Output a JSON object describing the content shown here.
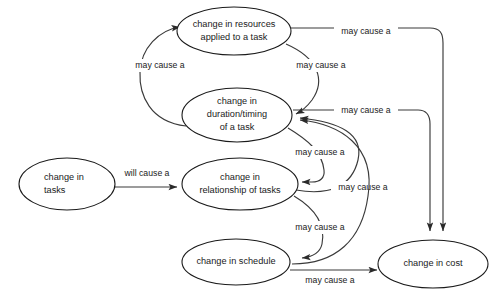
{
  "diagram": {
    "type": "causal-loop-diagram",
    "background_color": "#ffffff",
    "node_stroke_color": "#1a1a1a",
    "edge_stroke_color": "#3a3a3a",
    "text_color": "#1a1a1a",
    "nodes": [
      {
        "id": "resources",
        "label_lines": [
          "change in resources",
          "applied to a task"
        ],
        "align": "center",
        "cx": 234,
        "cy": 31,
        "rx": 57,
        "ry": 24
      },
      {
        "id": "duration",
        "label_lines": [
          "change in",
          "duration/timing",
          "of a task"
        ],
        "align": "center",
        "cx": 237,
        "cy": 115,
        "rx": 55,
        "ry": 27
      },
      {
        "id": "tasks",
        "label_lines": [
          "change in",
          "tasks"
        ],
        "align": "start",
        "cx": 67,
        "cy": 184,
        "rx": 48,
        "ry": 26
      },
      {
        "id": "relationship",
        "label_lines": [
          "change in",
          "relationship  of tasks"
        ],
        "align": "center",
        "cx": 240,
        "cy": 184,
        "rx": 58,
        "ry": 26
      },
      {
        "id": "schedule",
        "label_lines": [
          "change in schedule"
        ],
        "align": "center",
        "cx": 236,
        "cy": 262,
        "rx": 54,
        "ry": 23
      },
      {
        "id": "cost",
        "label_lines": [
          "change in cost"
        ],
        "align": "center",
        "cx": 433,
        "cy": 264,
        "rx": 55,
        "ry": 24
      }
    ],
    "edges": [
      {
        "id": "duration-to-resources",
        "from": "duration",
        "to": "resources",
        "label": "may cause a",
        "label_x": 160,
        "label_y": 66
      },
      {
        "id": "resources-to-duration",
        "from": "resources",
        "to": "duration",
        "label": "may cause a",
        "label_x": 321,
        "label_y": 66
      },
      {
        "id": "resources-to-cost",
        "from": "resources",
        "to": "cost",
        "label": "may cause a",
        "label_x": 366,
        "label_y": 32
      },
      {
        "id": "duration-to-cost",
        "from": "duration",
        "to": "cost",
        "label": "may cause a",
        "label_x": 366,
        "label_y": 111
      },
      {
        "id": "tasks-to-relationship",
        "from": "tasks",
        "to": "relationship",
        "label": "will cause a",
        "label_x": 147,
        "label_y": 174
      },
      {
        "id": "duration-to-relationship",
        "from": "duration",
        "to": "relationship",
        "label": "may cause a",
        "label_x": 320,
        "label_y": 153
      },
      {
        "id": "relationship-to-duration",
        "from": "relationship",
        "to": "duration",
        "label": "may cause a",
        "label_x": 363,
        "label_y": 188
      },
      {
        "id": "relationship-to-schedule",
        "from": "relationship",
        "to": "schedule",
        "label": "may cause a",
        "label_x": 320,
        "label_y": 228
      },
      {
        "id": "schedule-to-duration",
        "from": "schedule",
        "to": "duration",
        "label": "may cause a",
        "label_x": 363,
        "label_y": 188
      },
      {
        "id": "schedule-to-cost",
        "from": "schedule",
        "to": "cost",
        "label": "may cause a",
        "label_x": 330,
        "label_y": 281
      }
    ]
  }
}
